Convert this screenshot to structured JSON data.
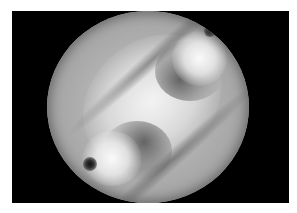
{
  "image": {
    "description": "Grayscale circular aperture image with diagonal bright band and two vortex-like features with dark cores",
    "background_color": "#ffffff",
    "frame_color": "#000000",
    "features": [
      {
        "name": "upper-right vortex",
        "type": "bright lobe with dark core"
      },
      {
        "name": "lower-left vortex",
        "type": "bright lobe with dark core"
      },
      {
        "name": "diagonal bright band",
        "type": "central bright region"
      }
    ]
  }
}
